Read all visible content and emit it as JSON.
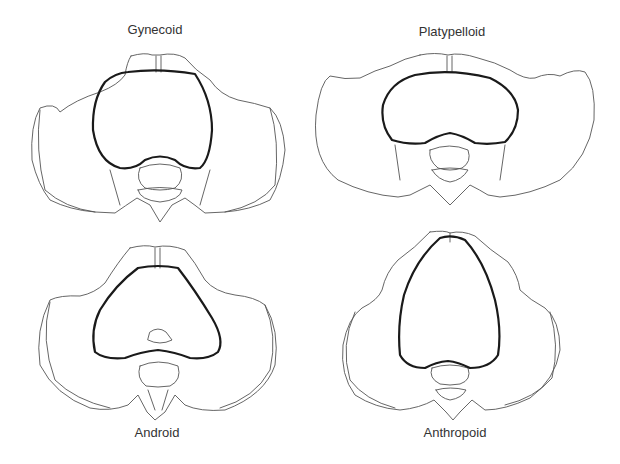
{
  "diagram": {
    "panels": [
      {
        "label": "Gynecoid",
        "position": "top-left",
        "inlet_shape": "round / heart"
      },
      {
        "label": "Platypelloid",
        "position": "top-right",
        "inlet_shape": "wide oval (flattened)"
      },
      {
        "label": "Android",
        "position": "bottom-left",
        "inlet_shape": "triangular / heart"
      },
      {
        "label": "Anthropoid",
        "position": "bottom-right",
        "inlet_shape": "long narrow oval"
      }
    ],
    "colors": {
      "background": "#ffffff",
      "outline": "#555555",
      "inlet": "#1a1a1a",
      "text": "#333333"
    }
  }
}
